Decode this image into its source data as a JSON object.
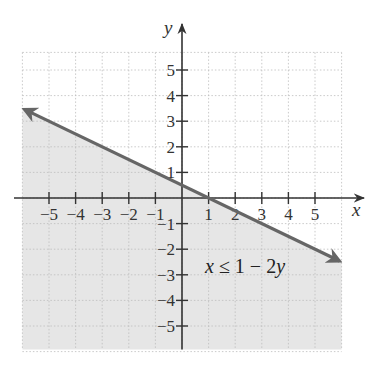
{
  "chart_data": {
    "type": "line",
    "title": "",
    "xlabel": "x",
    "ylabel": "y",
    "xlim": [
      -6,
      6
    ],
    "ylim": [
      -6,
      6
    ],
    "grid": true,
    "x_ticks": [
      -5,
      -4,
      -3,
      -2,
      -1,
      1,
      2,
      3,
      4,
      5
    ],
    "y_ticks": [
      -5,
      -4,
      -3,
      -2,
      -1,
      1,
      2,
      3,
      4,
      5
    ],
    "x_tick_labels": [
      "−5",
      "−4",
      "−3",
      "−2",
      "−1",
      "1",
      "2",
      "3",
      "4",
      "5"
    ],
    "y_tick_labels": [
      "−5",
      "−4",
      "−3",
      "−2",
      "−1",
      "1",
      "2",
      "3",
      "4",
      "5"
    ],
    "series": [
      {
        "name": "boundary line x = 1 − 2y",
        "x": [
          -6,
          6
        ],
        "y": [
          3.5,
          -2.5
        ],
        "style": "solid",
        "arrows": "both",
        "color": "#666666"
      }
    ],
    "shaded_region": {
      "description": "half-plane below the line (y ≤ (1 − x)/2)",
      "color": "#e6e6e6"
    },
    "annotations": [
      {
        "text": "x ≤ 1 − 2y",
        "x": 3,
        "y": -2.5
      }
    ]
  },
  "labels": {
    "x_axis": "x",
    "y_axis": "y",
    "inequality": {
      "var1": "x",
      "op": " ≤ 1 − 2",
      "var2": "y"
    }
  },
  "colors": {
    "line": "#666666",
    "shade": "#e6e6e6",
    "axis": "#333333",
    "grid": "#bdbdbd"
  }
}
